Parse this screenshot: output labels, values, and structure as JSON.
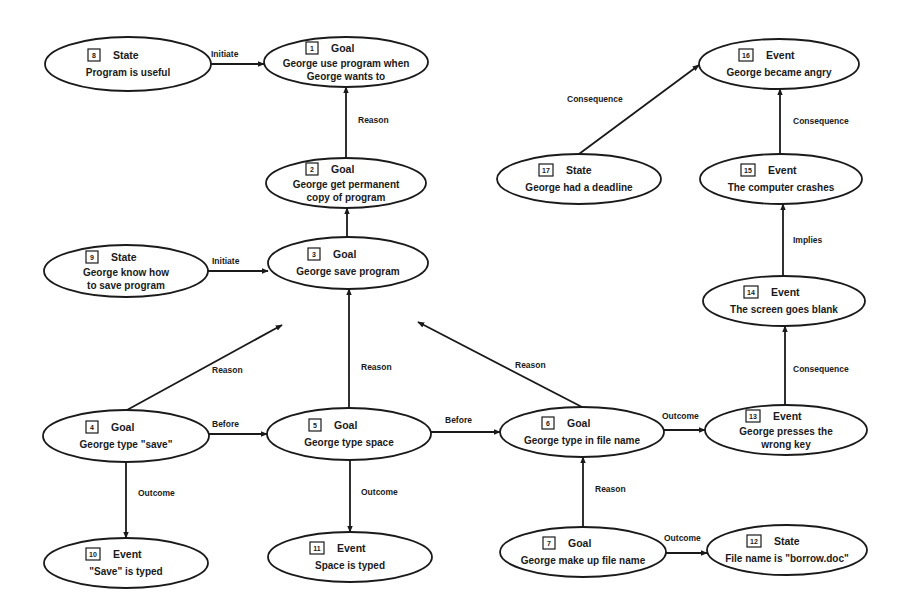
{
  "diagram": {
    "type": "causal-network",
    "nodes": [
      {
        "id": "1",
        "type": "Goal",
        "lines": [
          "George use program when",
          "George wants to"
        ],
        "cx": 346,
        "cy": 62,
        "rx": 82,
        "ry": 25
      },
      {
        "id": "2",
        "type": "Goal",
        "lines": [
          "George get permanent",
          "copy of program"
        ],
        "cx": 346,
        "cy": 183,
        "rx": 80,
        "ry": 25
      },
      {
        "id": "3",
        "type": "Goal",
        "lines": [
          "George save program"
        ],
        "cx": 348,
        "cy": 263,
        "rx": 80,
        "ry": 26
      },
      {
        "id": "4",
        "type": "Goal",
        "lines": [
          "George type \"save\""
        ],
        "cx": 126,
        "cy": 436,
        "rx": 83,
        "ry": 26
      },
      {
        "id": "5",
        "type": "Goal",
        "lines": [
          "George type space"
        ],
        "cx": 349,
        "cy": 434,
        "rx": 82,
        "ry": 26
      },
      {
        "id": "6",
        "type": "Goal",
        "lines": [
          "George type in file name"
        ],
        "cx": 582,
        "cy": 432,
        "rx": 82,
        "ry": 25
      },
      {
        "id": "7",
        "type": "Goal",
        "lines": [
          "George make up file name"
        ],
        "cx": 583,
        "cy": 552,
        "rx": 83,
        "ry": 25
      },
      {
        "id": "8",
        "type": "State",
        "lines": [
          "Program is useful"
        ],
        "cx": 128,
        "cy": 64,
        "rx": 83,
        "ry": 27
      },
      {
        "id": "9",
        "type": "State",
        "lines": [
          "George know how",
          "to save program"
        ],
        "cx": 126,
        "cy": 271,
        "rx": 82,
        "ry": 26
      },
      {
        "id": "10",
        "type": "Event",
        "lines": [
          "\"Save\" is typed"
        ],
        "cx": 126,
        "cy": 563,
        "rx": 82,
        "ry": 25
      },
      {
        "id": "11",
        "type": "Event",
        "lines": [
          "Space is typed"
        ],
        "cx": 350,
        "cy": 557,
        "rx": 82,
        "ry": 25
      },
      {
        "id": "12",
        "type": "State",
        "lines": [
          "File name is \"borrow.doc\""
        ],
        "cx": 787,
        "cy": 550,
        "rx": 80,
        "ry": 25
      },
      {
        "id": "13",
        "type": "Event",
        "lines": [
          "George presses the",
          "wrong key"
        ],
        "cx": 786,
        "cy": 430,
        "rx": 81,
        "ry": 25
      },
      {
        "id": "14",
        "type": "Event",
        "lines": [
          "The screen goes blank"
        ],
        "cx": 784,
        "cy": 301,
        "rx": 81,
        "ry": 25
      },
      {
        "id": "15",
        "type": "Event",
        "lines": [
          "The computer crashes"
        ],
        "cx": 781,
        "cy": 179,
        "rx": 81,
        "ry": 25
      },
      {
        "id": "16",
        "type": "Event",
        "lines": [
          "George became angry"
        ],
        "cx": 779,
        "cy": 64,
        "rx": 80,
        "ry": 25
      },
      {
        "id": "17",
        "type": "State",
        "lines": [
          "George had a deadline"
        ],
        "cx": 579,
        "cy": 179,
        "rx": 82,
        "ry": 25
      }
    ],
    "edges": [
      {
        "from": "8",
        "to": "1",
        "label": "Initiate",
        "x1": 211,
        "y1": 64,
        "x2": 264,
        "y2": 64,
        "lx": 211,
        "ly": 54
      },
      {
        "from": "2",
        "to": "1",
        "label": "Reason",
        "x1": 346,
        "y1": 158,
        "x2": 346,
        "y2": 87,
        "lx": 358,
        "ly": 120
      },
      {
        "from": "3",
        "to": "2",
        "label": "Reason",
        "x1": 347,
        "y1": 237,
        "x2": 347,
        "y2": 208,
        "lx": 358,
        "ly": 243
      },
      {
        "from": "9",
        "to": "3",
        "label": "Initiate",
        "x1": 208,
        "y1": 271,
        "x2": 268,
        "y2": 271,
        "lx": 212,
        "ly": 261
      },
      {
        "from": "4",
        "to": "3",
        "label": "Reason",
        "x1": 127,
        "y1": 410,
        "x2": 282,
        "y2": 325,
        "lx": 212,
        "ly": 370
      },
      {
        "from": "5",
        "to": "3",
        "label": "Reason",
        "x1": 349,
        "y1": 408,
        "x2": 349,
        "y2": 289,
        "lx": 361,
        "ly": 367
      },
      {
        "from": "6",
        "to": "3",
        "label": "Reason",
        "x1": 582,
        "y1": 407,
        "x2": 418,
        "y2": 322,
        "lx": 515,
        "ly": 365
      },
      {
        "from": "4",
        "to": "5",
        "label": "Before",
        "x1": 209,
        "y1": 434,
        "x2": 267,
        "y2": 434,
        "lx": 212,
        "ly": 424
      },
      {
        "from": "5",
        "to": "6",
        "label": "Before",
        "x1": 431,
        "y1": 432,
        "x2": 500,
        "y2": 432,
        "lx": 445,
        "ly": 420
      },
      {
        "from": "6",
        "to": "13",
        "label": "Outcome",
        "x1": 664,
        "y1": 430,
        "x2": 705,
        "y2": 430,
        "lx": 662,
        "ly": 416
      },
      {
        "from": "4",
        "to": "10",
        "label": "Outcome",
        "x1": 126,
        "y1": 462,
        "x2": 126,
        "y2": 538,
        "lx": 138,
        "ly": 493
      },
      {
        "from": "5",
        "to": "11",
        "label": "Outcome",
        "x1": 350,
        "y1": 460,
        "x2": 350,
        "y2": 532,
        "lx": 361,
        "ly": 492
      },
      {
        "from": "7",
        "to": "6",
        "label": "Reason",
        "x1": 583,
        "y1": 527,
        "x2": 583,
        "y2": 457,
        "lx": 595,
        "ly": 489
      },
      {
        "from": "7",
        "to": "12",
        "label": "Outcome",
        "x1": 666,
        "y1": 553,
        "x2": 707,
        "y2": 553,
        "lx": 664,
        "ly": 538
      },
      {
        "from": "13",
        "to": "14",
        "label": "Consequence",
        "x1": 785,
        "y1": 405,
        "x2": 785,
        "y2": 326,
        "lx": 793,
        "ly": 369
      },
      {
        "from": "14",
        "to": "15",
        "label": "Implies",
        "x1": 783,
        "y1": 276,
        "x2": 783,
        "y2": 204,
        "lx": 793,
        "ly": 240
      },
      {
        "from": "15",
        "to": "16",
        "label": "Consequence",
        "x1": 780,
        "y1": 154,
        "x2": 780,
        "y2": 89,
        "lx": 793,
        "ly": 121
      },
      {
        "from": "17",
        "to": "16",
        "label": "Consequence",
        "x1": 579,
        "y1": 154,
        "x2": 699,
        "y2": 65,
        "lx": 567,
        "ly": 99
      }
    ]
  }
}
